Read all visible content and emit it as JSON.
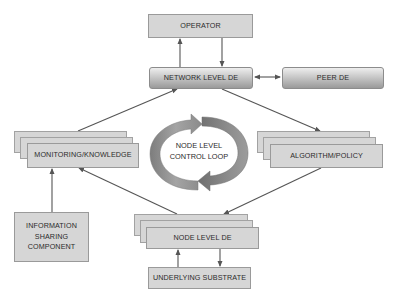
{
  "diagram": {
    "operator": "OPERATOR",
    "network_level_de": "NETWORK LEVEL DE",
    "peer_de": "PEER DE",
    "monitoring_knowledge": "MONITORING/KNOWLEDGE",
    "algorithm_policy": "ALGORITHM/POLICY",
    "control_loop": [
      "NODE LEVEL",
      "CONTROL LOOP"
    ],
    "information_sharing": [
      "INFORMATION",
      "SHARING",
      "COMPONENT"
    ],
    "node_level_de": "NODE LEVEL DE",
    "underlying_substrate": "UNDERLYING SUBSTRATE"
  },
  "colors": {
    "box_fill": "#d6d6d6",
    "box_border": "#9a9a9a",
    "arrow": "#555555",
    "loop_arrow": "#8f8f8f"
  },
  "connections": [
    {
      "from": "network_level_de",
      "to": "operator"
    },
    {
      "from": "operator",
      "to": "network_level_de"
    },
    {
      "from": "network_level_de",
      "to": "peer_de",
      "bidirectional": true
    },
    {
      "from": "monitoring_knowledge",
      "to": "network_level_de"
    },
    {
      "from": "network_level_de",
      "to": "algorithm_policy"
    },
    {
      "from": "algorithm_policy",
      "to": "node_level_de"
    },
    {
      "from": "node_level_de",
      "to": "monitoring_knowledge"
    },
    {
      "from": "information_sharing",
      "to": "monitoring_knowledge"
    },
    {
      "from": "underlying_substrate",
      "to": "node_level_de"
    },
    {
      "from": "node_level_de",
      "to": "underlying_substrate"
    }
  ]
}
